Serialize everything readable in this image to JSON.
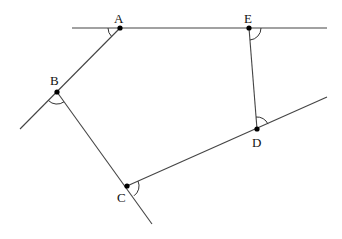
{
  "diagram": {
    "type": "geometry",
    "points": [
      {
        "id": "A",
        "label": "A",
        "x": 120,
        "y": 28,
        "label_x": 114,
        "label_y": 23
      },
      {
        "id": "B",
        "label": "B",
        "x": 57,
        "y": 92,
        "label_x": 50,
        "label_y": 84
      },
      {
        "id": "C",
        "label": "C",
        "x": 127,
        "y": 186,
        "label_x": 117,
        "label_y": 202
      },
      {
        "id": "D",
        "label": "D",
        "x": 257,
        "y": 129,
        "label_x": 252,
        "label_y": 147
      },
      {
        "id": "E",
        "label": "E",
        "x": 249,
        "y": 28,
        "label_x": 244,
        "label_y": 23
      }
    ],
    "labels": {
      "A": "A",
      "B": "B",
      "C": "C",
      "D": "D",
      "E": "E"
    },
    "segments": [
      {
        "name": "line-AE-extended",
        "x1": 72,
        "y1": 28,
        "x2": 327,
        "y2": 28
      },
      {
        "name": "line-AB-extended",
        "x1": 120,
        "y1": 28,
        "x2": 20,
        "y2": 129
      },
      {
        "name": "line-BC-extended",
        "x1": 57,
        "y1": 92,
        "x2": 152,
        "y2": 224
      },
      {
        "name": "line-CD-extended",
        "x1": 127,
        "y1": 186,
        "x2": 327,
        "y2": 97
      },
      {
        "name": "segment-ED",
        "x1": 249,
        "y1": 28,
        "x2": 257,
        "y2": 129
      }
    ],
    "angle_marks": [
      {
        "vertex": "A",
        "description": "angle between line AE (left) and AB"
      },
      {
        "vertex": "B",
        "description": "angle between BA-extension and BC (below B)"
      },
      {
        "vertex": "C",
        "description": "angle between CD and BC-extension (right of C)"
      },
      {
        "vertex": "D",
        "description": "angle between DE and DC-extension (above D)"
      },
      {
        "vertex": "E",
        "description": "angle between AE-extension and ED (right of E)"
      }
    ],
    "colors": {
      "line": "#444444",
      "point": "#000000",
      "background": "#ffffff"
    }
  }
}
